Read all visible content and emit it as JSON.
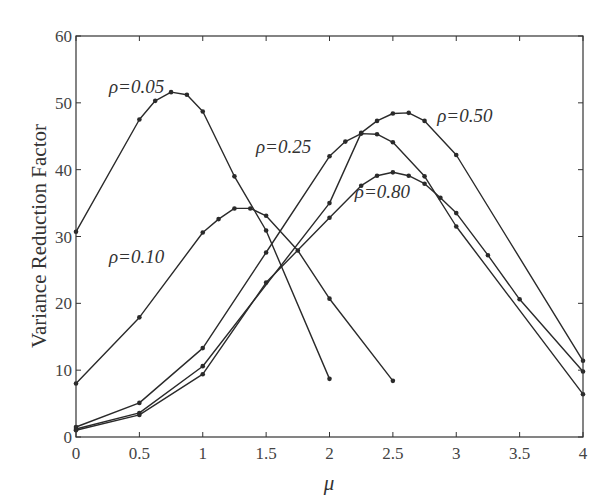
{
  "chart_data": {
    "type": "line",
    "title": "",
    "xlabel": "μ",
    "ylabel": "Variance Reduction Factor",
    "xlim": [
      0,
      4
    ],
    "ylim": [
      0,
      60
    ],
    "xticks": [
      0,
      0.5,
      1,
      1.5,
      2,
      2.5,
      3,
      3.5,
      4
    ],
    "xtick_labels": [
      "0",
      "0.5",
      "1",
      "1.5",
      "2",
      "2.5",
      "3",
      "3.5",
      "4"
    ],
    "yticks": [
      0,
      10,
      20,
      30,
      40,
      50,
      60
    ],
    "ytick_labels": [
      "0",
      "10",
      "20",
      "30",
      "40",
      "50",
      "60"
    ],
    "grid": false,
    "legend": "inline labels",
    "series": [
      {
        "name": "ρ=0.05",
        "label_pos": [
          0.26,
          51.5
        ],
        "x": [
          0,
          0.5,
          0.625,
          0.75,
          0.875,
          1.0,
          1.25,
          1.5,
          2.0
        ],
        "y": [
          30.7,
          47.5,
          50.3,
          51.6,
          51.2,
          48.7,
          39.0,
          30.9,
          8.7
        ]
      },
      {
        "name": "ρ=0.10",
        "label_pos": [
          0.26,
          26.0
        ],
        "x": [
          0,
          0.5,
          1.0,
          1.125,
          1.25,
          1.375,
          1.5,
          1.75,
          2.0,
          2.5
        ],
        "y": [
          8.0,
          17.9,
          30.6,
          32.6,
          34.2,
          34.2,
          33.1,
          27.9,
          20.7,
          8.4
        ]
      },
      {
        "name": "ρ=0.25",
        "label_pos": [
          1.42,
          42.5
        ],
        "x": [
          0,
          0.5,
          1.0,
          1.5,
          2.0,
          2.125,
          2.25,
          2.375,
          2.5,
          2.75,
          3.0,
          4.0
        ],
        "y": [
          1.5,
          5.1,
          13.3,
          27.6,
          42.0,
          44.2,
          45.4,
          45.3,
          44.1,
          39.0,
          31.5,
          6.4
        ]
      },
      {
        "name": "ρ=0.50",
        "label_pos": [
          2.85,
          47.2
        ],
        "x": [
          0,
          0.5,
          1.0,
          2.0,
          2.25,
          2.375,
          2.5,
          2.625,
          2.75,
          3.0,
          4.0
        ],
        "y": [
          1.2,
          3.6,
          10.6,
          35.0,
          45.5,
          47.3,
          48.4,
          48.5,
          47.3,
          42.2,
          11.4
        ]
      },
      {
        "name": "ρ=0.80",
        "label_pos": [
          2.2,
          35.8
        ],
        "x": [
          0,
          0.5,
          1.0,
          1.5,
          2.0,
          2.25,
          2.375,
          2.5,
          2.625,
          2.75,
          2.875,
          3.0,
          3.25,
          3.5,
          4.0
        ],
        "y": [
          1.0,
          3.3,
          9.4,
          23.1,
          32.8,
          37.6,
          39.1,
          39.6,
          39.1,
          37.9,
          35.8,
          33.5,
          27.2,
          20.6,
          9.8
        ]
      }
    ],
    "colors": {
      "line": "#2a2a2a",
      "frame": "#333333",
      "background": "#ffffff"
    }
  },
  "layout": {
    "plot_left": 76,
    "plot_right": 583,
    "plot_top": 36,
    "plot_bottom": 437
  }
}
